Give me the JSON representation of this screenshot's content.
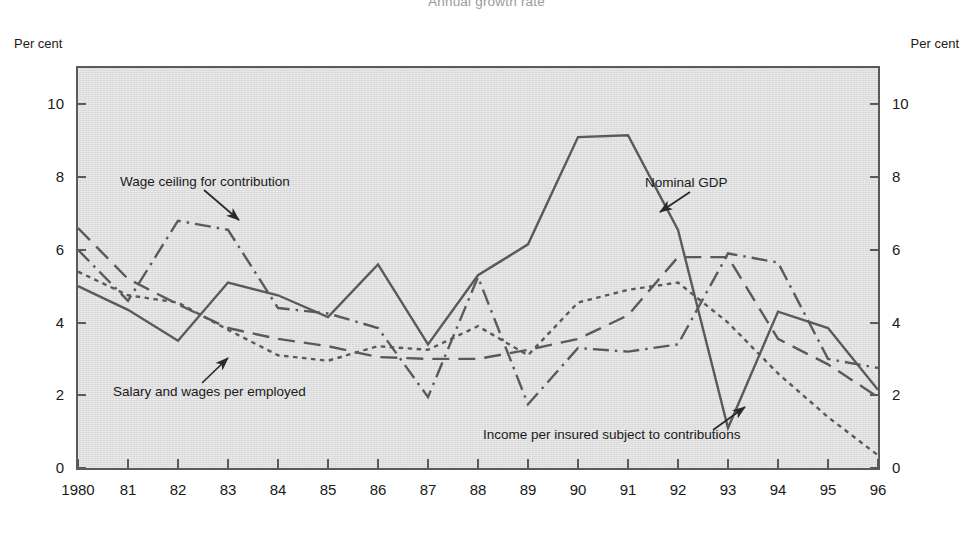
{
  "title": "Annual growth rate",
  "axis_caption_left": "Per cent",
  "axis_caption_right": "Per cent",
  "colors": {
    "plot_background": "#dedede",
    "axis": "#5a5a5a",
    "line": "#5a5a5a",
    "text": "#1a1a1a",
    "title": "#9a9a9a"
  },
  "annotations": {
    "wage_ceiling": "Wage ceiling for contribution",
    "salary_wages": "Salary and wages per employed",
    "nominal_gdp": "Nominal GDP",
    "income_insured": "Income per insured subject to contributions"
  },
  "chart_data": {
    "type": "line",
    "title": "Annual growth rate",
    "xlabel": "",
    "ylabel": "Per cent",
    "ylim": [
      0,
      11
    ],
    "yticks": [
      0,
      2,
      4,
      6,
      8,
      10
    ],
    "ytick_labels": [
      "0",
      "2",
      "4",
      "6",
      "8",
      "10"
    ],
    "grid": false,
    "legend": "annotations-on-plot",
    "x": [
      1980,
      1981,
      1982,
      1983,
      1984,
      1985,
      1986,
      1987,
      1988,
      1989,
      1990,
      1991,
      1992,
      1993,
      1994,
      1995,
      1996
    ],
    "xtick_labels": [
      "1980",
      "81",
      "82",
      "83",
      "84",
      "85",
      "86",
      "87",
      "88",
      "89",
      "90",
      "91",
      "92",
      "93",
      "94",
      "95",
      "96"
    ],
    "series": [
      {
        "name": "Nominal GDP",
        "style": "solid",
        "values": [
          5.0,
          4.35,
          3.5,
          5.1,
          4.75,
          4.15,
          5.6,
          3.4,
          5.3,
          6.15,
          9.1,
          9.15,
          6.55,
          1.1,
          4.3,
          3.85,
          2.15
        ]
      },
      {
        "name": "Salary and wages per employed",
        "style": "dashed",
        "values": [
          6.6,
          5.2,
          4.5,
          3.85,
          3.55,
          3.35,
          3.05,
          3.0,
          3.0,
          3.25,
          3.55,
          4.2,
          5.8,
          5.8,
          3.55,
          2.85,
          1.95
        ]
      },
      {
        "name": "Wage ceiling for contribution",
        "style": "dashdot",
        "values": [
          6.0,
          4.6,
          6.8,
          6.55,
          4.4,
          4.25,
          3.85,
          1.95,
          5.25,
          1.75,
          3.3,
          3.2,
          3.4,
          5.9,
          5.65,
          3.0,
          2.75
        ]
      },
      {
        "name": "Income per insured subject to contributions",
        "style": "dotted",
        "values": [
          5.4,
          4.75,
          4.55,
          3.8,
          3.1,
          2.95,
          3.35,
          3.25,
          3.9,
          3.1,
          4.55,
          4.9,
          5.1,
          4.0,
          2.6,
          1.4,
          0.35
        ]
      }
    ]
  }
}
